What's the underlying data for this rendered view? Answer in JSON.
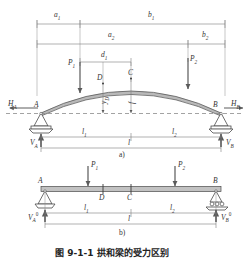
{
  "figure": {
    "caption_zh": "图 9-1-1  拱和梁的受力区别",
    "panel_a_label": "a)",
    "panel_b_label": "b)"
  },
  "colors": {
    "line": "#5a5a5a",
    "dim": "#7d7d7d",
    "arch_fill": "#b9b9b9",
    "beam_fill": "#c2c2c2",
    "text": "#2f2f2f",
    "axis_dash": "#8c8c8c"
  },
  "panel_a": {
    "name": "arch-diagram",
    "dimensions_top": [
      {
        "id": "a1",
        "label": "a",
        "sub": "1"
      },
      {
        "id": "b1",
        "label": "b",
        "sub": "1"
      }
    ],
    "dimensions_second": [
      {
        "id": "a2",
        "label": "a",
        "sub": "2"
      },
      {
        "id": "b2",
        "label": "b",
        "sub": "2"
      }
    ],
    "dimensions_third": [
      {
        "id": "d1",
        "label": "d",
        "sub": "1"
      }
    ],
    "loads": [
      {
        "id": "P1",
        "label": "P",
        "sub": "1"
      },
      {
        "id": "P2",
        "label": "P",
        "sub": "2"
      }
    ],
    "points": [
      {
        "id": "A",
        "label": "A"
      },
      {
        "id": "B",
        "label": "B"
      },
      {
        "id": "C",
        "label": "C"
      },
      {
        "id": "D",
        "label": "D"
      }
    ],
    "reactions": [
      {
        "id": "HA",
        "label": "H",
        "sub": "A"
      },
      {
        "id": "HB",
        "label": "H",
        "sub": "B"
      },
      {
        "id": "VA",
        "label": "V",
        "sub": "A"
      },
      {
        "id": "VB",
        "label": "V",
        "sub": "B"
      }
    ],
    "rise": [
      {
        "id": "yD",
        "label": "y",
        "sub": "D"
      },
      {
        "id": "f",
        "label": "f",
        "sub": ""
      }
    ],
    "spans": [
      {
        "id": "l1",
        "label": "l",
        "sub": "1"
      },
      {
        "id": "l2",
        "label": "l",
        "sub": "2"
      },
      {
        "id": "l",
        "label": "l",
        "sub": ""
      }
    ]
  },
  "panel_b": {
    "name": "beam-diagram",
    "loads": [
      {
        "id": "P1",
        "label": "P",
        "sub": "1"
      },
      {
        "id": "P2",
        "label": "P",
        "sub": "2"
      }
    ],
    "points": [
      {
        "id": "A",
        "label": "A"
      },
      {
        "id": "B",
        "label": "B"
      },
      {
        "id": "C",
        "label": "C"
      },
      {
        "id": "D",
        "label": "D"
      }
    ],
    "reactions": [
      {
        "id": "VA0",
        "label": "V",
        "sub": "A",
        "sup": "0"
      },
      {
        "id": "VB0",
        "label": "V",
        "sub": "B",
        "sup": "0"
      }
    ],
    "spans": [
      {
        "id": "l1",
        "label": "l",
        "sub": "1"
      },
      {
        "id": "l2",
        "label": "l",
        "sub": "2"
      },
      {
        "id": "l",
        "label": "l",
        "sub": ""
      }
    ]
  }
}
